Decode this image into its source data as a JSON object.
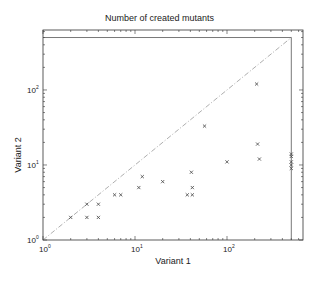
{
  "chart_data": {
    "type": "scatter",
    "title": "Number of created mutants",
    "xlabel": "Variant 1",
    "ylabel": "Variant 2",
    "xscale": "log",
    "yscale": "log",
    "xlim": [
      1,
      670
    ],
    "ylim": [
      1,
      630
    ],
    "x_ticks": [
      "10^0",
      "10^1",
      "10^2"
    ],
    "y_ticks": [
      "10^0",
      "10^1",
      "10^2"
    ],
    "grid": false,
    "legend": null,
    "marker": "x",
    "reference_line": {
      "style": "dash-dot",
      "description": "y = x diagonal",
      "from": [
        1,
        1
      ],
      "to": [
        500,
        500
      ]
    },
    "cap_lines": {
      "x": 500,
      "y": 500
    },
    "series": [
      {
        "name": "mutants",
        "points": [
          [
            2,
            2
          ],
          [
            3,
            3
          ],
          [
            3,
            2
          ],
          [
            4,
            3
          ],
          [
            4,
            2
          ],
          [
            6,
            4
          ],
          [
            7,
            4
          ],
          [
            11,
            5
          ],
          [
            12,
            7
          ],
          [
            20,
            6
          ],
          [
            37,
            4
          ],
          [
            42,
            4
          ],
          [
            41,
            8
          ],
          [
            42,
            5
          ],
          [
            57,
            33
          ],
          [
            100,
            11
          ],
          [
            210,
            120
          ],
          [
            215,
            19
          ],
          [
            225,
            12
          ],
          [
            500,
            9
          ],
          [
            500,
            10
          ],
          [
            500,
            11
          ],
          [
            500,
            13
          ],
          [
            500,
            14
          ]
        ]
      }
    ]
  },
  "labels": {
    "title": "Number of created mutants",
    "xlabel": "Variant 1",
    "ylabel": "Variant 2"
  },
  "colors": {
    "axis": "#333333",
    "marker": "#444444",
    "reference": "#999999"
  }
}
